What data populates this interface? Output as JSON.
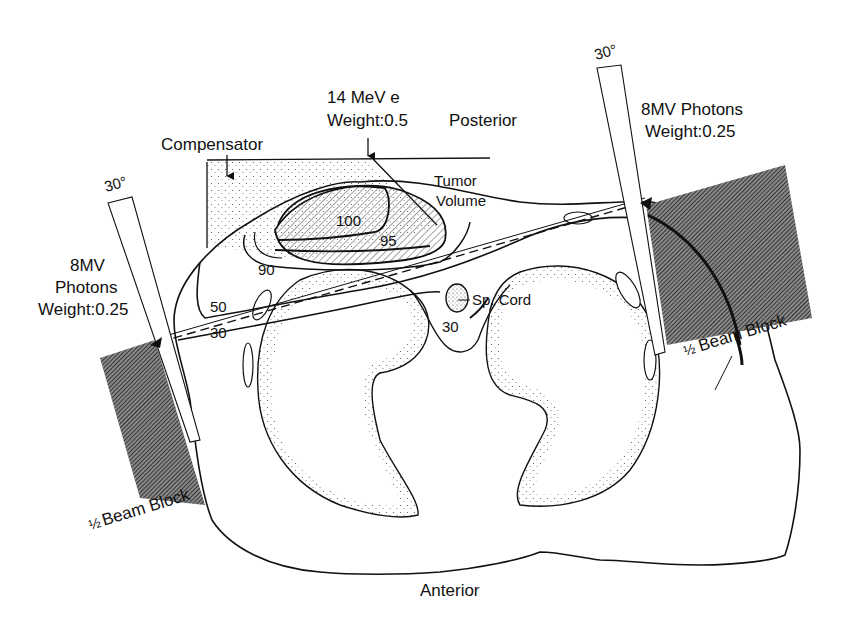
{
  "diagram": {
    "type": "radiotherapy isodose treatment plan (axial cross-section)",
    "orientation": {
      "top": "Posterior",
      "bottom": "Anterior"
    },
    "beams": [
      {
        "id": "electron",
        "line1": "14 MeV  e",
        "line2": "Weight:0.5"
      },
      {
        "id": "photon-left",
        "line1": "8MV",
        "line2": "Photons",
        "line3": "Weight:0.25",
        "wedge_angle": "30°",
        "block_label_frac": "½",
        "block_label": "Beam Block"
      },
      {
        "id": "photon-right",
        "line1": "8MV Photons",
        "line2": "Weight:0.25",
        "wedge_angle": "30°",
        "block_label_frac": "½",
        "block_label": "Beam Block"
      }
    ],
    "structures": {
      "compensator": "Compensator",
      "tumor_line1": "Tumor",
      "tumor_line2": "Volume",
      "spinal_cord": "Sp. Cord"
    },
    "isodose_labels": {
      "i100": "100",
      "i95": "95",
      "i90": "90",
      "i50": "50",
      "i30_left": "30",
      "i30_cord": "30"
    },
    "colors": {
      "ink": "#111111",
      "stipple": "#555555",
      "hatch_dark": "#3a3a3a",
      "background": "#ffffff"
    }
  }
}
